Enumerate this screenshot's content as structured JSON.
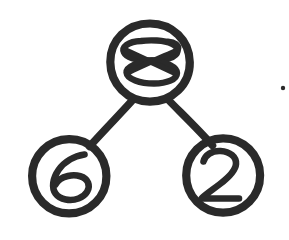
{
  "diagram": {
    "style": "hand-drawn ink sketch",
    "background_color": "#ffffff",
    "stroke_color": "#2a2a2a",
    "nodes": [
      {
        "id": "root",
        "label": "8",
        "role": "root-node",
        "shape": "circle",
        "cx": 150,
        "cy": 62,
        "r": 39,
        "label_note": "digit 8 drawn with overlapping crossed strokes"
      },
      {
        "id": "left",
        "label": "6",
        "role": "left-child-node",
        "shape": "circle",
        "cx": 69,
        "cy": 176,
        "r": 37
      },
      {
        "id": "right",
        "label": "2",
        "role": "right-child-node",
        "shape": "circle",
        "cx": 223,
        "cy": 175,
        "r": 37
      }
    ],
    "edges": [
      {
        "id": "edge-root-left",
        "from": "root",
        "to": "left",
        "x1": 133,
        "y1": 99,
        "x2": 89,
        "y2": 147
      },
      {
        "id": "edge-root-right",
        "from": "root",
        "to": "right",
        "x1": 168,
        "y1": 99,
        "x2": 212,
        "y2": 146
      }
    ],
    "marks": [
      {
        "id": "ink-speck",
        "type": "stray-ink-speck",
        "cx": 283,
        "cy": 88,
        "r": 2.2
      }
    ]
  }
}
